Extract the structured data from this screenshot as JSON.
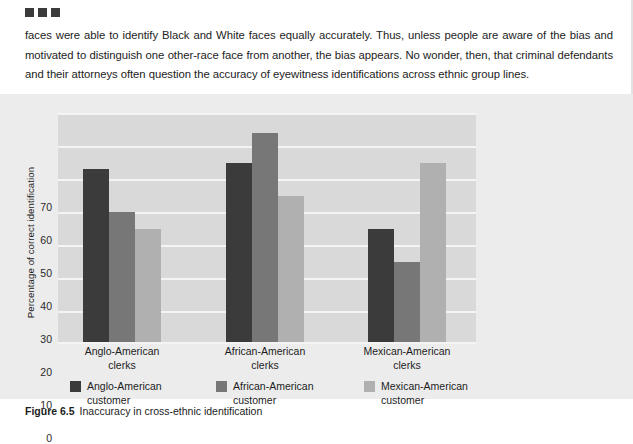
{
  "document": {
    "marker_count": 3,
    "body_text": "faces were able to identify Black and White faces equally accurately. Thus, unless people are aware of the bias and motivated to distinguish one other-race face from another, the bias appears. No wonder, then, that criminal defendants and their attorneys often question the accuracy of eyewitness identifications across ethnic group lines.",
    "figure_number": "Figure 6.5",
    "figure_caption": "Inaccuracy in cross-ethnic identification"
  },
  "chart_data": {
    "type": "bar",
    "title": "",
    "xlabel": "",
    "ylabel": "Percentage of correct identification",
    "categories": [
      "Anglo-American clerks",
      "African-American clerks",
      "Mexican-American clerks"
    ],
    "category_lines": [
      [
        "Anglo-American",
        "clerks"
      ],
      [
        "African-American",
        "clerks"
      ],
      [
        "Mexican-American",
        "clerks"
      ]
    ],
    "series": [
      {
        "name": "Anglo-American customer",
        "name_lines": [
          "Anglo-American",
          "customer"
        ],
        "color": "#3b3b3b",
        "values": [
          53,
          55,
          35
        ]
      },
      {
        "name": "African-American customer",
        "name_lines": [
          "African-American",
          "customer"
        ],
        "color": "#777777",
        "values": [
          40,
          64,
          25
        ]
      },
      {
        "name": "Mexican-American customer",
        "name_lines": [
          "Mexican-American",
          "customer"
        ],
        "color": "#b0b0b0",
        "values": [
          35,
          45,
          55
        ]
      }
    ],
    "ylim": [
      0,
      70
    ],
    "yticks": [
      70,
      60,
      50,
      40,
      30,
      20,
      10,
      0
    ],
    "grid": true,
    "legend_position": "bottom",
    "plot_background": "#d9d9d9",
    "panel_background": "#ececec",
    "gridline_color": "#f4f4f4"
  }
}
